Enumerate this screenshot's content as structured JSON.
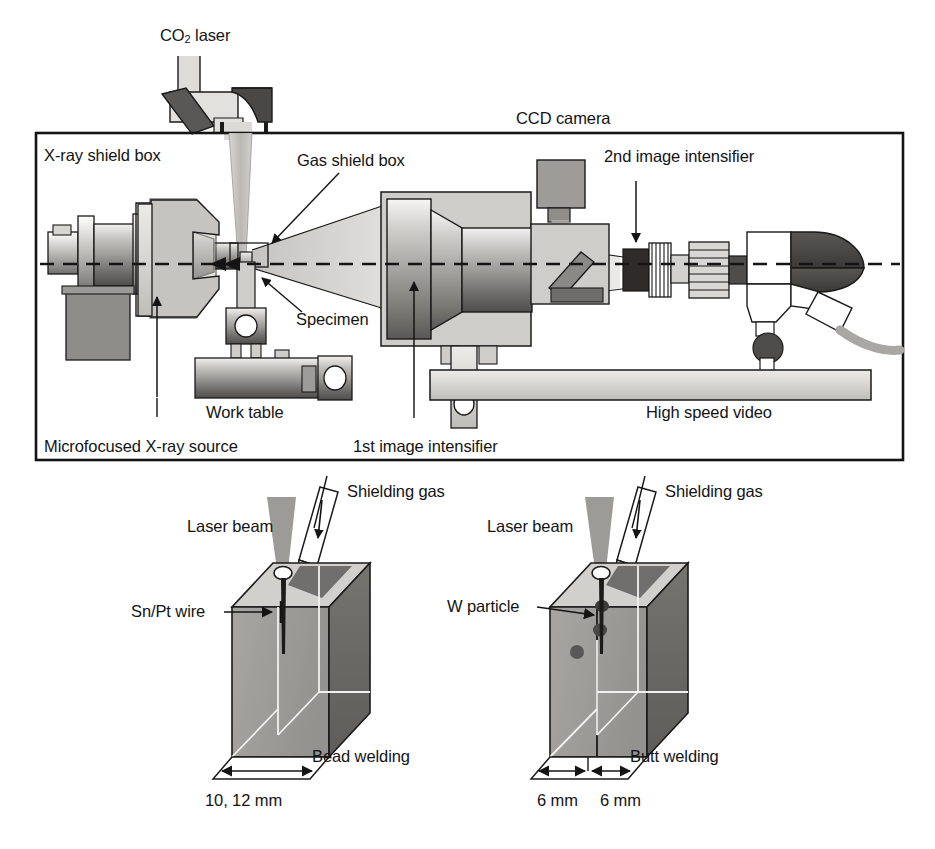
{
  "figure": {
    "type": "technical-schematic",
    "title_visible": false,
    "panels": [
      "x-ray-shield-box-setup",
      "bead-welding-specimen",
      "butt-welding-specimen"
    ]
  },
  "top_panel": {
    "enclosure_label": "X-ray shield box",
    "labels": {
      "co2_laser": "CO",
      "co2_laser_sub": "2",
      "co2_laser_tail": " laser",
      "ccd_camera": "CCD camera",
      "gas_shield_box": "Gas shield box",
      "second_intensifier": "2nd image intensifier",
      "specimen": "Specimen",
      "work_table": "Work table",
      "high_speed_video": "High speed video",
      "microfocused_source": "Microfocused X-ray source",
      "first_intensifier": "1st image intensifier"
    }
  },
  "bottom_left_panel": {
    "laser_beam": "Laser beam",
    "shielding_gas": "Shielding gas",
    "wire": "Sn/Pt wire",
    "process": "Bead welding",
    "dimension": "10, 12 mm"
  },
  "bottom_right_panel": {
    "laser_beam": "Laser beam",
    "shielding_gas": "Shielding gas",
    "particle": "W particle",
    "process": "Butt welding",
    "dimension_1": "6 mm",
    "dimension_2": "6 mm"
  },
  "colors": {
    "ink": "#141414",
    "line": "#1a1a1a",
    "fill_light": "#e6e4e1",
    "fill_mid": "#a9a7a4",
    "fill_dark": "#6e6c6a",
    "fill_darker": "#4a4846",
    "beam_grey": "#b9b7b4",
    "block_front": "#9d9b98",
    "block_side": "#6b6967",
    "block_top": "#d6d4d1",
    "white": "#ffffff"
  }
}
